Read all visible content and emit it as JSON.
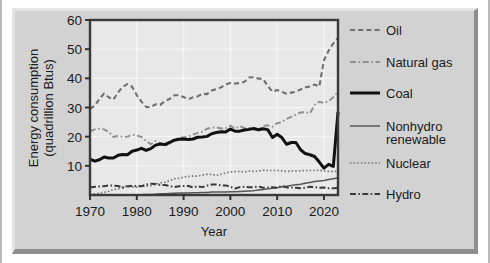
{
  "chart_data": {
    "type": "line",
    "title": "",
    "xlabel": "Year",
    "ylabel": "Energy consumption (quadrillion Btus)",
    "ylabel_line1": "Energy consumption",
    "ylabel_line2": "(quadrillion Btus)",
    "xlim": [
      1970,
      2023
    ],
    "ylim": [
      0,
      60
    ],
    "xticks": [
      1970,
      1980,
      1990,
      2000,
      2010,
      2020
    ],
    "yticks": [
      10,
      20,
      30,
      40,
      50,
      60
    ],
    "grid": true,
    "legend_position": "right",
    "x": [
      1970,
      1971,
      1972,
      1973,
      1974,
      1975,
      1976,
      1977,
      1978,
      1979,
      1980,
      1981,
      1982,
      1983,
      1984,
      1985,
      1986,
      1987,
      1988,
      1989,
      1990,
      1991,
      1992,
      1993,
      1994,
      1995,
      1996,
      1997,
      1998,
      1999,
      2000,
      2001,
      2002,
      2003,
      2004,
      2005,
      2006,
      2007,
      2008,
      2009,
      2010,
      2011,
      2012,
      2013,
      2014,
      2015,
      2016,
      2017,
      2018,
      2019,
      2020,
      2021,
      2022,
      2023
    ],
    "series": [
      {
        "name": "Oil",
        "style": "dashed",
        "color": "#6f6f6f",
        "values": [
          29.5,
          30.6,
          32.9,
          34.8,
          33.5,
          32.7,
          35.2,
          37.1,
          38.0,
          37.1,
          34.2,
          32.0,
          30.2,
          30.1,
          31.1,
          30.9,
          32.2,
          32.9,
          34.2,
          34.2,
          33.6,
          32.8,
          33.5,
          33.8,
          34.7,
          34.6,
          35.8,
          36.3,
          36.9,
          37.9,
          38.4,
          38.2,
          38.4,
          38.8,
          40.3,
          40.4,
          39.9,
          39.8,
          37.3,
          35.4,
          36.0,
          35.4,
          34.7,
          35.1,
          35.4,
          36.2,
          36.9,
          37.2,
          37.9,
          37.2,
          46.2,
          49.5,
          52.0,
          53.8
        ]
      },
      {
        "name": "Natural gas",
        "style": "dashdot",
        "color": "#8f8f8f",
        "values": [
          21.8,
          22.5,
          22.7,
          22.5,
          21.7,
          19.9,
          20.3,
          19.9,
          20.0,
          20.7,
          20.4,
          19.9,
          18.5,
          17.4,
          18.5,
          17.8,
          16.7,
          17.7,
          18.6,
          19.7,
          19.7,
          20.1,
          20.7,
          21.3,
          21.7,
          22.7,
          23.1,
          23.2,
          22.8,
          22.9,
          23.8,
          22.8,
          23.6,
          22.9,
          23.0,
          22.6,
          22.2,
          23.7,
          23.9,
          23.4,
          24.6,
          25.0,
          26.1,
          26.8,
          27.5,
          28.3,
          28.4,
          28.0,
          30.9,
          32.0,
          31.5,
          32.2,
          33.5,
          35.5
        ]
      },
      {
        "name": "Coal",
        "style": "solid-thick",
        "color": "#111111",
        "values": [
          12.3,
          11.6,
          12.1,
          13.0,
          12.7,
          12.7,
          13.6,
          13.9,
          13.8,
          15.0,
          15.4,
          16.0,
          15.3,
          15.9,
          17.1,
          17.5,
          17.3,
          18.0,
          18.8,
          19.1,
          19.2,
          19.0,
          19.2,
          19.8,
          19.9,
          20.1,
          21.0,
          21.4,
          21.7,
          21.6,
          22.6,
          21.9,
          21.9,
          22.3,
          22.5,
          22.8,
          22.4,
          22.7,
          22.4,
          19.7,
          20.8,
          19.7,
          17.4,
          18.0,
          18.0,
          15.5,
          14.2,
          13.8,
          13.2,
          11.3,
          9.2,
          10.5,
          9.8,
          28.5
        ]
      },
      {
        "name": "Nonhydro renewable",
        "style": "solid-thin",
        "color": "#555555",
        "values": [
          0.1,
          0.1,
          0.1,
          0.1,
          0.1,
          0.1,
          0.1,
          0.1,
          0.1,
          0.1,
          0.1,
          0.1,
          0.2,
          0.2,
          0.3,
          0.4,
          0.4,
          0.5,
          0.6,
          0.7,
          0.7,
          0.7,
          0.8,
          0.8,
          0.9,
          0.9,
          1.0,
          1.0,
          1.0,
          1.0,
          1.1,
          1.1,
          1.2,
          1.3,
          1.4,
          1.5,
          1.7,
          1.9,
          2.1,
          2.3,
          2.5,
          2.8,
          3.0,
          3.3,
          3.5,
          3.7,
          4.0,
          4.3,
          4.6,
          4.8,
          5.0,
          5.3,
          5.6,
          5.9
        ]
      },
      {
        "name": "Nuclear",
        "style": "dotted",
        "color": "#7a7a7a",
        "values": [
          0.2,
          0.4,
          0.6,
          0.9,
          1.3,
          1.9,
          2.1,
          2.7,
          3.0,
          2.8,
          2.7,
          3.0,
          3.1,
          3.2,
          3.6,
          4.1,
          4.4,
          4.9,
          5.6,
          5.7,
          6.1,
          6.4,
          6.5,
          6.5,
          6.8,
          7.1,
          7.1,
          6.7,
          7.1,
          7.6,
          7.9,
          8.0,
          8.1,
          7.9,
          8.2,
          8.1,
          8.2,
          8.5,
          8.4,
          8.4,
          8.4,
          8.3,
          8.1,
          8.2,
          8.3,
          8.3,
          8.4,
          8.4,
          8.4,
          8.5,
          8.3,
          8.1,
          8.1,
          8.1
        ]
      },
      {
        "name": "Hydro",
        "style": "dashdotdash",
        "color": "#3a3a3a",
        "values": [
          2.6,
          2.8,
          2.9,
          3.0,
          3.3,
          3.2,
          3.1,
          2.5,
          3.0,
          3.1,
          3.1,
          3.0,
          3.6,
          3.9,
          3.8,
          3.4,
          3.4,
          3.1,
          2.7,
          3.0,
          3.1,
          3.1,
          2.6,
          3.0,
          2.7,
          3.2,
          3.6,
          3.6,
          3.3,
          3.3,
          2.8,
          2.2,
          2.7,
          2.8,
          2.7,
          2.7,
          2.9,
          2.5,
          2.5,
          2.7,
          2.5,
          3.1,
          2.6,
          2.6,
          2.5,
          2.3,
          2.5,
          2.8,
          2.7,
          2.5,
          2.6,
          2.3,
          2.3,
          2.4
        ]
      }
    ],
    "legend": [
      {
        "label": "Oil",
        "style": "dashed"
      },
      {
        "label": "Natural gas",
        "style": "dashdot"
      },
      {
        "label": "Coal",
        "style": "solid-thick"
      },
      {
        "label": "Nonhydro renewable",
        "label_line1": "Nonhydro",
        "label_line2": "renewable",
        "style": "solid-thin"
      },
      {
        "label": "Nuclear",
        "style": "dotted"
      },
      {
        "label": "Hydro",
        "style": "dashdotdash"
      }
    ]
  },
  "colors": {
    "plaque": "#d2d2d2",
    "plot_background": "#e8e8e8",
    "grid": "#f4f4f4",
    "axis": "#333333",
    "text": "#1a1a1a"
  }
}
